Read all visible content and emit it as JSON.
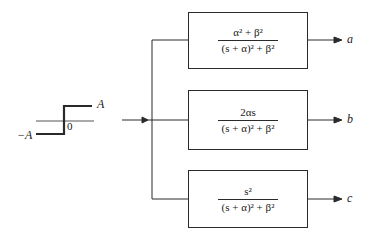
{
  "input_signal": {
    "type": "step",
    "high_label": "A",
    "low_label": "−A",
    "origin_label": "0"
  },
  "blocks": [
    {
      "id": "a",
      "numerator_html": "α² + β²",
      "denominator_html": "(s + α)² + β²",
      "output_label": "a"
    },
    {
      "id": "b",
      "numerator_html": "2αs",
      "denominator_html": "(s + α)² + β²",
      "output_label": "b"
    },
    {
      "id": "c",
      "numerator_html": "s²",
      "denominator_html": "(s + α)² + β²",
      "output_label": "c"
    }
  ],
  "colors": {
    "line": "#2a2a2a",
    "background": "#ffffff"
  }
}
